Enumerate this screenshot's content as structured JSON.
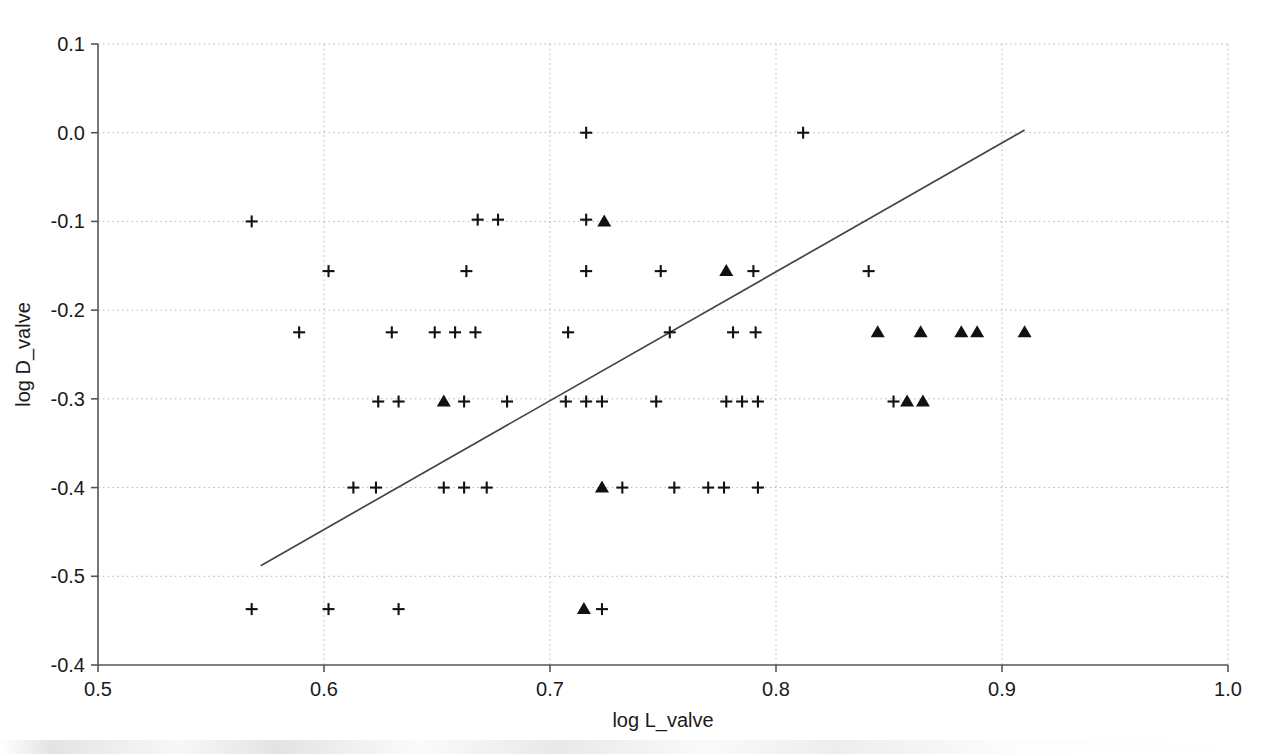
{
  "chart_data": {
    "type": "scatter",
    "title": "",
    "xlabel": "log L_valve",
    "ylabel": "log D_valve",
    "xlim": [
      0.5,
      1.0
    ],
    "ylim": [
      -0.6,
      0.1
    ],
    "grid": true,
    "legend_position": "none",
    "x_ticks": [
      "0.5",
      "0.6",
      "0.7",
      "0.8",
      "0.9",
      "1.0"
    ],
    "x_tick_values": [
      0.5,
      0.6,
      0.7,
      0.8,
      0.9,
      1.0
    ],
    "y_ticks": [
      "0.1",
      "0.0",
      "-0.1",
      "-0.2",
      "-0.3",
      "-0.4",
      "-0.5",
      "-0.4"
    ],
    "y_tick_values": [
      0.1,
      0.0,
      -0.1,
      -0.2,
      -0.3,
      -0.4,
      -0.5,
      -0.6
    ],
    "series": [
      {
        "name": "cross-points",
        "marker": "plus",
        "color": "#111111",
        "points": [
          [
            0.716,
            0.0
          ],
          [
            0.812,
            0.0
          ],
          [
            0.568,
            -0.1
          ],
          [
            0.668,
            -0.098
          ],
          [
            0.677,
            -0.098
          ],
          [
            0.716,
            -0.098
          ],
          [
            0.602,
            -0.156
          ],
          [
            0.663,
            -0.156
          ],
          [
            0.716,
            -0.156
          ],
          [
            0.749,
            -0.156
          ],
          [
            0.79,
            -0.156
          ],
          [
            0.841,
            -0.156
          ],
          [
            0.589,
            -0.225
          ],
          [
            0.63,
            -0.225
          ],
          [
            0.649,
            -0.225
          ],
          [
            0.658,
            -0.225
          ],
          [
            0.667,
            -0.225
          ],
          [
            0.708,
            -0.225
          ],
          [
            0.753,
            -0.225
          ],
          [
            0.781,
            -0.225
          ],
          [
            0.791,
            -0.225
          ],
          [
            0.624,
            -0.303
          ],
          [
            0.633,
            -0.303
          ],
          [
            0.662,
            -0.303
          ],
          [
            0.681,
            -0.303
          ],
          [
            0.707,
            -0.303
          ],
          [
            0.716,
            -0.303
          ],
          [
            0.723,
            -0.303
          ],
          [
            0.747,
            -0.303
          ],
          [
            0.778,
            -0.303
          ],
          [
            0.785,
            -0.303
          ],
          [
            0.792,
            -0.303
          ],
          [
            0.852,
            -0.303
          ],
          [
            0.613,
            -0.4
          ],
          [
            0.623,
            -0.4
          ],
          [
            0.653,
            -0.4
          ],
          [
            0.662,
            -0.4
          ],
          [
            0.672,
            -0.4
          ],
          [
            0.732,
            -0.4
          ],
          [
            0.755,
            -0.4
          ],
          [
            0.77,
            -0.4
          ],
          [
            0.777,
            -0.4
          ],
          [
            0.792,
            -0.4
          ],
          [
            0.568,
            -0.537
          ],
          [
            0.602,
            -0.537
          ],
          [
            0.633,
            -0.537
          ],
          [
            0.723,
            -0.537
          ]
        ]
      },
      {
        "name": "triangle-points",
        "marker": "triangle",
        "color": "#111111",
        "points": [
          [
            0.724,
            -0.1
          ],
          [
            0.778,
            -0.156
          ],
          [
            0.845,
            -0.225
          ],
          [
            0.864,
            -0.225
          ],
          [
            0.882,
            -0.225
          ],
          [
            0.889,
            -0.225
          ],
          [
            0.91,
            -0.225
          ],
          [
            0.653,
            -0.303
          ],
          [
            0.858,
            -0.303
          ],
          [
            0.865,
            -0.303
          ],
          [
            0.723,
            -0.4
          ],
          [
            0.715,
            -0.537
          ]
        ]
      }
    ],
    "fit_line": {
      "name": "regression-line",
      "x_start": 0.572,
      "y_start": -0.488,
      "x_end": 0.91,
      "y_end": 0.003,
      "color": "#444444"
    }
  }
}
